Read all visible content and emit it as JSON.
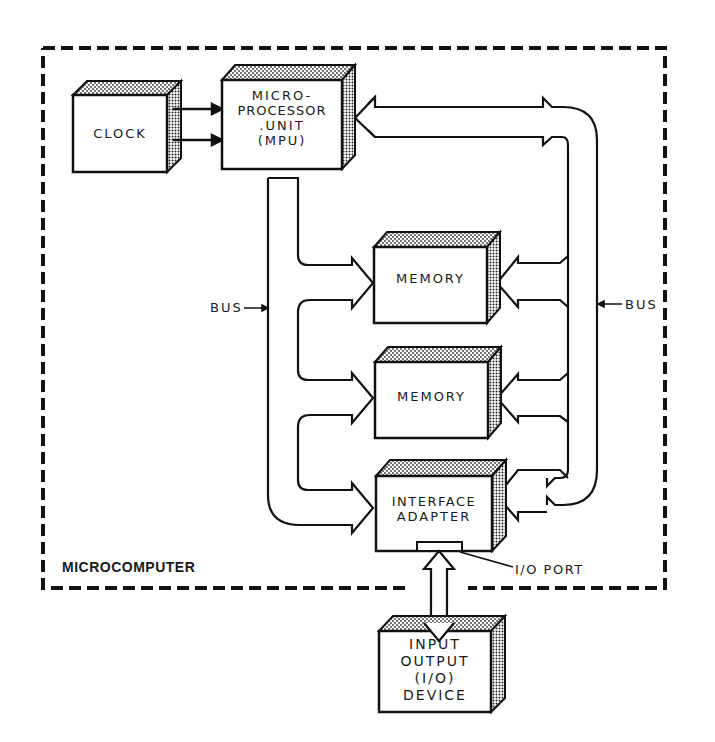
{
  "diagram": {
    "container_label": "MICROCOMPUTER",
    "blocks": {
      "clock": "CLOCK",
      "mpu": [
        "MICRO-",
        "PROCESSOR",
        ".UNIT",
        "(MPU)"
      ],
      "memory1": "MEMORY",
      "memory2": "MEMORY",
      "interface": [
        "INTERFACE",
        "ADAPTER"
      ],
      "io_device": [
        "INPUT",
        "OUTPUT",
        "(I/O)",
        "DEVICE"
      ]
    },
    "labels": {
      "bus_left": "BUS",
      "bus_right": "BUS",
      "io_port": "I/O PORT"
    },
    "colors": {
      "ink": "#1a1a1a",
      "background": "#ffffff"
    }
  }
}
